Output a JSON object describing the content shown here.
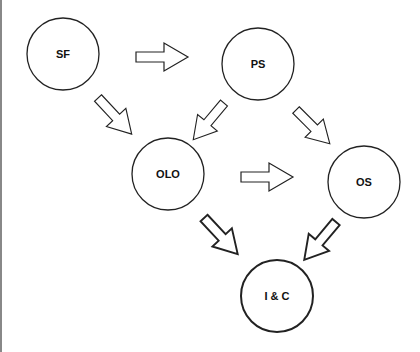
{
  "diagram": {
    "type": "flow",
    "nodes": [
      {
        "id": "SF",
        "label": "SF",
        "cx": 63,
        "cy": 54,
        "r": 36,
        "bold": false
      },
      {
        "id": "PS",
        "label": "PS",
        "cx": 258,
        "cy": 64,
        "r": 36,
        "bold": false
      },
      {
        "id": "OLO",
        "label": "OLO",
        "cx": 168,
        "cy": 174,
        "r": 36,
        "bold": false
      },
      {
        "id": "OS",
        "label": "OS",
        "cx": 364,
        "cy": 182,
        "r": 36,
        "bold": false
      },
      {
        "id": "IC",
        "label": "I & C",
        "cx": 277,
        "cy": 296,
        "r": 36,
        "bold": true
      }
    ],
    "edges": [
      {
        "from": "SF",
        "to": "PS"
      },
      {
        "from": "SF",
        "to": "OLO"
      },
      {
        "from": "PS",
        "to": "OLO"
      },
      {
        "from": "PS",
        "to": "OS"
      },
      {
        "from": "OLO",
        "to": "OS"
      },
      {
        "from": "OLO",
        "to": "IC"
      },
      {
        "from": "OS",
        "to": "IC"
      }
    ],
    "colors": {
      "stroke": "#222222",
      "fill": "#ffffff",
      "background": "#ffffff"
    }
  }
}
